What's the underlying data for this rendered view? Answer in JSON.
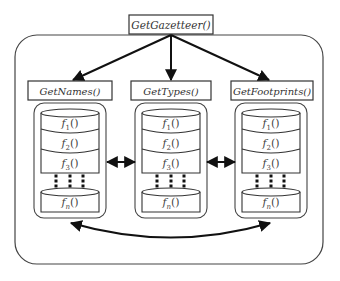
{
  "diagram": {
    "root": {
      "label": "GetGazetteer()"
    },
    "components": [
      {
        "label": "GetNames()",
        "functions": [
          {
            "f": "f",
            "sub": "1",
            "paren": "()"
          },
          {
            "f": "f",
            "sub": "2",
            "paren": "()"
          },
          {
            "f": "f",
            "sub": "3",
            "paren": "()"
          },
          {
            "f": "f",
            "sub": "n",
            "paren": "()"
          }
        ]
      },
      {
        "label": "GetTypes()",
        "functions": [
          {
            "f": "f",
            "sub": "1",
            "paren": "()"
          },
          {
            "f": "f",
            "sub": "2",
            "paren": "()"
          },
          {
            "f": "f",
            "sub": "3",
            "paren": "()"
          },
          {
            "f": "f",
            "sub": "n",
            "paren": "()"
          }
        ]
      },
      {
        "label": "GetFootprints()",
        "functions": [
          {
            "f": "f",
            "sub": "1",
            "paren": "()"
          },
          {
            "f": "f",
            "sub": "2",
            "paren": "()"
          },
          {
            "f": "f",
            "sub": "3",
            "paren": "()"
          },
          {
            "f": "f",
            "sub": "n",
            "paren": "()"
          }
        ]
      }
    ],
    "edges": [
      {
        "from": "GetGazetteer()",
        "to": "GetNames()",
        "type": "directed"
      },
      {
        "from": "GetGazetteer()",
        "to": "GetTypes()",
        "type": "directed"
      },
      {
        "from": "GetGazetteer()",
        "to": "GetFootprints()",
        "type": "directed"
      },
      {
        "from": "GetNames()",
        "to": "GetTypes()",
        "type": "bidirectional"
      },
      {
        "from": "GetTypes()",
        "to": "GetFootprints()",
        "type": "bidirectional"
      },
      {
        "from": "GetNames()",
        "to": "GetFootprints()",
        "type": "bidirectional-curved"
      }
    ],
    "colors": {
      "stroke": "#333333",
      "arrow": "#111111",
      "background": "#ffffff"
    }
  }
}
